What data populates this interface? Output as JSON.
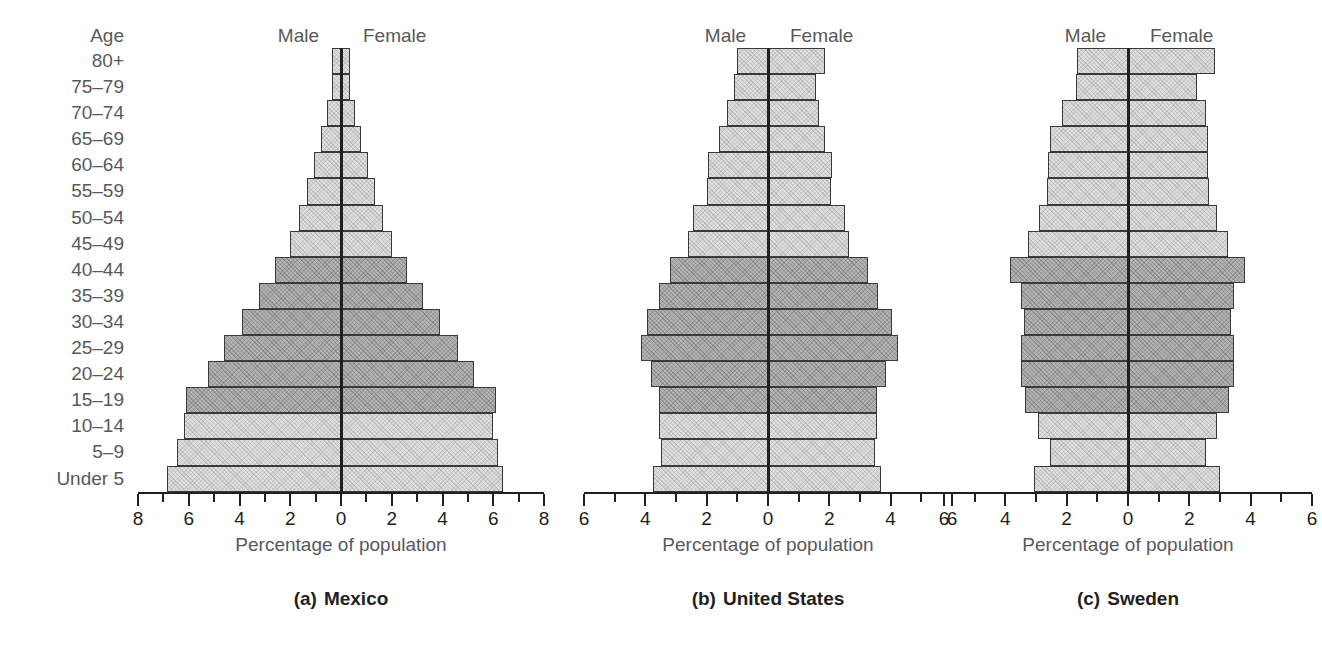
{
  "figure": {
    "age_axis_title": "Age",
    "age_groups": [
      "80+",
      "75–79",
      "70–74",
      "65–69",
      "60–64",
      "55–59",
      "50–54",
      "45–49",
      "40–44",
      "35–39",
      "30–34",
      "25–29",
      "20–24",
      "15–19",
      "10–14",
      "5–9",
      "Under 5"
    ],
    "male_label": "Male",
    "female_label": "Female",
    "axis_title": "Percentage of population",
    "colors": {
      "light_band": "#dededc",
      "dark_band": "#b3b3b1",
      "bar_border": "#3a3a3a",
      "center_line": "#231f20",
      "label_gray": "#58595b"
    }
  },
  "chart_data": [
    {
      "type": "bar",
      "subtype": "population-pyramid",
      "panel_letter": "(a)",
      "title": "Mexico",
      "xlabel": "Percentage of population",
      "ylabel": "Age",
      "xlim": [
        -8,
        8
      ],
      "xticks": [
        -8,
        -7,
        -6,
        -5,
        -4,
        -3,
        -2,
        -1,
        0,
        1,
        2,
        3,
        4,
        5,
        6,
        7,
        8
      ],
      "xticklabels_major": [
        8,
        6,
        4,
        2,
        0,
        2,
        4,
        6,
        8
      ],
      "grid": false,
      "legend_position": "top",
      "categories": [
        "80+",
        "75–79",
        "70–74",
        "65–69",
        "60–64",
        "55–59",
        "50–54",
        "45–49",
        "40–44",
        "35–39",
        "30–34",
        "25–29",
        "20–24",
        "15–19",
        "10–14",
        "5–9",
        "Under 5"
      ],
      "series": [
        {
          "name": "Male",
          "values": [
            0.35,
            0.35,
            0.55,
            0.8,
            1.05,
            1.35,
            1.65,
            2.0,
            2.6,
            3.25,
            3.9,
            4.6,
            5.25,
            6.1,
            6.2,
            6.45,
            6.85
          ]
        },
        {
          "name": "Female",
          "values": [
            0.35,
            0.35,
            0.55,
            0.8,
            1.05,
            1.35,
            1.65,
            2.0,
            2.6,
            3.25,
            3.9,
            4.6,
            5.25,
            6.1,
            6.0,
            6.2,
            6.4
          ]
        }
      ],
      "band_tones": [
        "light",
        "light",
        "light",
        "light",
        "light",
        "light",
        "light",
        "light",
        "dark",
        "dark",
        "dark",
        "dark",
        "dark",
        "dark",
        "light",
        "light",
        "light"
      ]
    },
    {
      "type": "bar",
      "subtype": "population-pyramid",
      "panel_letter": "(b)",
      "title": "United States",
      "xlabel": "Percentage of population",
      "ylabel": "Age",
      "xlim": [
        -6,
        6
      ],
      "xticks": [
        -6,
        -5,
        -4,
        -3,
        -2,
        -1,
        0,
        1,
        2,
        3,
        4,
        5,
        6
      ],
      "xticklabels_major": [
        6,
        4,
        2,
        0,
        2,
        4,
        6
      ],
      "grid": false,
      "legend_position": "top",
      "categories": [
        "80+",
        "75–79",
        "70–74",
        "65–69",
        "60–64",
        "55–59",
        "50–54",
        "45–49",
        "40–44",
        "35–39",
        "30–34",
        "25–29",
        "20–24",
        "15–19",
        "10–14",
        "5–9",
        "Under 5"
      ],
      "series": [
        {
          "name": "Male",
          "values": [
            1.0,
            1.1,
            1.35,
            1.6,
            1.95,
            2.0,
            2.45,
            2.6,
            3.2,
            3.55,
            3.95,
            4.15,
            3.8,
            3.55,
            3.55,
            3.5,
            3.75
          ]
        },
        {
          "name": "Female",
          "values": [
            1.85,
            1.55,
            1.65,
            1.85,
            2.1,
            2.05,
            2.5,
            2.65,
            3.25,
            3.6,
            4.05,
            4.25,
            3.85,
            3.55,
            3.55,
            3.5,
            3.7
          ]
        }
      ],
      "band_tones": [
        "light",
        "light",
        "light",
        "light",
        "light",
        "light",
        "light",
        "light",
        "dark",
        "dark",
        "dark",
        "dark",
        "dark",
        "dark",
        "light",
        "light",
        "light"
      ]
    },
    {
      "type": "bar",
      "subtype": "population-pyramid",
      "panel_letter": "(c)",
      "title": "Sweden",
      "xlabel": "Percentage of population",
      "ylabel": "Age",
      "xlim": [
        -6,
        6
      ],
      "xticks": [
        -6,
        -5,
        -4,
        -3,
        -2,
        -1,
        0,
        1,
        2,
        3,
        4,
        5,
        6
      ],
      "xticklabels_major": [
        6,
        4,
        2,
        0,
        2,
        4,
        6
      ],
      "grid": false,
      "legend_position": "top",
      "categories": [
        "80+",
        "75–79",
        "70–74",
        "65–69",
        "60–64",
        "55–59",
        "50–54",
        "45–49",
        "40–44",
        "35–39",
        "30–34",
        "25–29",
        "20–24",
        "15–19",
        "10–14",
        "5–9",
        "Under 5"
      ],
      "series": [
        {
          "name": "Male",
          "values": [
            1.65,
            1.7,
            2.15,
            2.55,
            2.6,
            2.65,
            2.9,
            3.25,
            3.85,
            3.5,
            3.4,
            3.5,
            3.5,
            3.35,
            2.95,
            2.55,
            3.05
          ]
        },
        {
          "name": "Female",
          "values": [
            2.85,
            2.25,
            2.55,
            2.6,
            2.6,
            2.65,
            2.9,
            3.25,
            3.8,
            3.45,
            3.35,
            3.45,
            3.45,
            3.3,
            2.9,
            2.55,
            3.0
          ]
        }
      ],
      "band_tones": [
        "light",
        "light",
        "light",
        "light",
        "light",
        "light",
        "light",
        "light",
        "dark",
        "dark",
        "dark",
        "dark",
        "dark",
        "dark",
        "light",
        "light",
        "light"
      ]
    }
  ]
}
